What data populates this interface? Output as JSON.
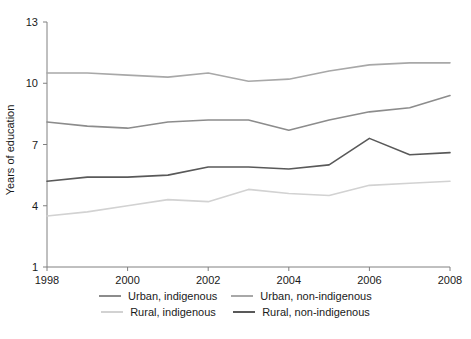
{
  "chart_data": {
    "type": "line",
    "title": "",
    "xlabel": "",
    "ylabel": "Years of education",
    "xlim": [
      1998,
      2008
    ],
    "ylim": [
      1,
      13
    ],
    "grid": false,
    "legend_position": "bottom",
    "x": [
      1998,
      1999,
      2000,
      2001,
      2002,
      2003,
      2004,
      2005,
      2006,
      2007,
      2008
    ],
    "xticks": [
      "1998",
      "2000",
      "2002",
      "2004",
      "2006",
      "2008"
    ],
    "xtick_values": [
      1998,
      2000,
      2002,
      2004,
      2006,
      2008
    ],
    "yticks": [
      "1",
      "4",
      "7",
      "10",
      "13"
    ],
    "ytick_values": [
      1,
      4,
      7,
      10,
      13
    ],
    "series": [
      {
        "name": "Urban, indigenous",
        "color": "#8c8c8c",
        "values": [
          8.1,
          7.9,
          7.8,
          8.1,
          8.2,
          8.2,
          7.7,
          8.2,
          8.6,
          8.8,
          9.4
        ]
      },
      {
        "name": "Urban, non-indigenous",
        "color": "#a8a8a8",
        "values": [
          10.5,
          10.5,
          10.4,
          10.3,
          10.5,
          10.1,
          10.2,
          10.6,
          10.9,
          11.0,
          11.0
        ]
      },
      {
        "name": "Rural, indigenous",
        "color": "#d2d2d2",
        "values": [
          3.5,
          3.7,
          4.0,
          4.3,
          4.2,
          4.8,
          4.6,
          4.5,
          5.0,
          5.1,
          5.2
        ]
      },
      {
        "name": "Rural, non-indigenous",
        "color": "#595959",
        "values": [
          5.2,
          5.4,
          5.4,
          5.5,
          5.9,
          5.9,
          5.8,
          6.0,
          7.3,
          6.5,
          6.6
        ]
      }
    ]
  },
  "legend": {
    "rows": [
      [
        {
          "label": "Urban, indigenous",
          "color": "#8c8c8c"
        },
        {
          "label": "Urban, non-indigenous",
          "color": "#a8a8a8"
        }
      ],
      [
        {
          "label": "Rural, indigenous",
          "color": "#d2d2d2"
        },
        {
          "label": "Rural, non-indigenous",
          "color": "#595959"
        }
      ]
    ]
  }
}
